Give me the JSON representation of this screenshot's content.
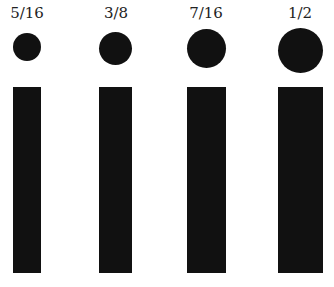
{
  "items": [
    {
      "label": "5/16",
      "fraction": 0.3125
    },
    {
      "label": "3/8",
      "fraction": 0.375
    },
    {
      "label": "7/16",
      "fraction": 0.4375
    },
    {
      "label": "1/2",
      "fraction": 0.5
    }
  ],
  "colors": {
    "fill": "#111111",
    "background": "#ffffff",
    "text": "#222222"
  }
}
